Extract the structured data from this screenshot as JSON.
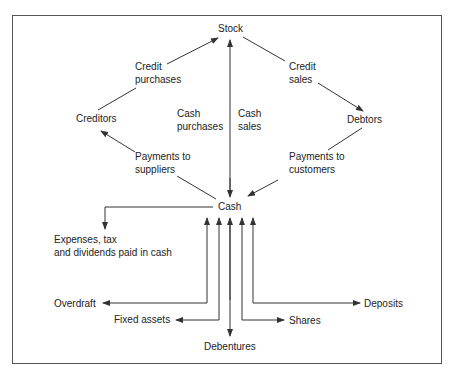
{
  "diagram": {
    "nodes": {
      "stock": "Stock",
      "creditors": "Creditors",
      "debtors": "Debtors",
      "cash": "Cash",
      "expenses_line1": "Expenses, tax",
      "expenses_line2": "and dividends paid in cash",
      "overdraft": "Overdraft",
      "fixed_assets": "Fixed assets",
      "debentures": "Debentures",
      "shares": "Shares",
      "deposits": "Deposits"
    },
    "edges": {
      "credit_purchases_1": "Credit",
      "credit_purchases_2": "purchases",
      "credit_sales_1": "Credit",
      "credit_sales_2": "sales",
      "cash_purchases_1": "Cash",
      "cash_purchases_2": "purchases",
      "cash_sales_1": "Cash",
      "cash_sales_2": "sales",
      "payments_suppliers_1": "Payments to",
      "payments_suppliers_2": "suppliers",
      "payments_customers_1": "Payments to",
      "payments_customers_2": "customers"
    },
    "colors": {
      "line": "#333333",
      "border": "#555555",
      "text": "#222222"
    }
  }
}
